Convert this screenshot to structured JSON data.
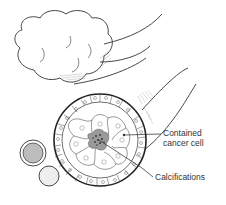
{
  "diagram": {
    "labels": {
      "contained_line1": "Contained",
      "contained_line2": "cancer cell",
      "calcifications": "Calcifications"
    },
    "colors": {
      "ink": "#222222",
      "lobule_shade": "#bbbbbb",
      "cancer_core": "#555555",
      "cancer_halo": "#9a9a9a",
      "sphere_fill": "#bdbdbd"
    }
  }
}
